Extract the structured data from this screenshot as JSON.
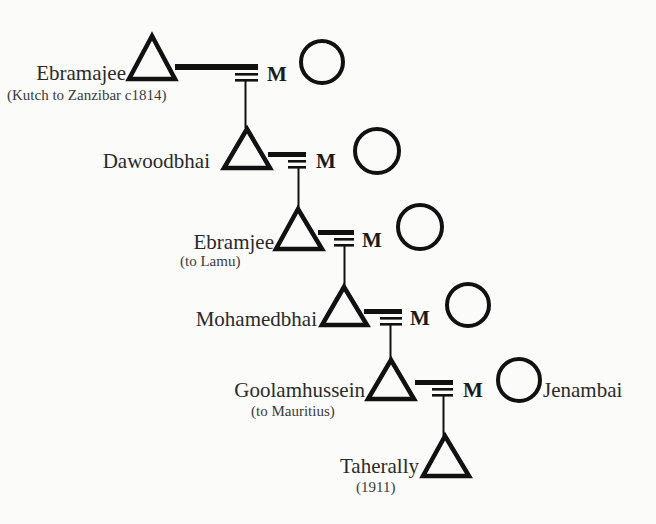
{
  "diagram": {
    "type": "genealogy-pedigree",
    "colors": {
      "stroke": "#111111",
      "text": "#2a2a2a",
      "background": "#fbfbfa"
    },
    "marriage_label": "M",
    "generations": [
      {
        "name": "Ebramajee",
        "note": "(Kutch to Zanzibar c1814)",
        "symbol": "male-triangle",
        "married": true,
        "spouse": {
          "symbol": "female-circle",
          "name": ""
        }
      },
      {
        "name": "Dawoodbhai",
        "note": "",
        "symbol": "male-triangle",
        "married": true,
        "spouse": {
          "symbol": "female-circle",
          "name": ""
        }
      },
      {
        "name": "Ebramjee",
        "note": "(to Lamu)",
        "symbol": "male-triangle",
        "married": true,
        "spouse": {
          "symbol": "female-circle",
          "name": ""
        }
      },
      {
        "name": "Mohamedbhai",
        "note": "",
        "symbol": "male-triangle",
        "married": true,
        "spouse": {
          "symbol": "female-circle",
          "name": ""
        }
      },
      {
        "name": "Goolamhussein",
        "note": "(to Mauritius)",
        "symbol": "male-triangle",
        "married": true,
        "spouse": {
          "symbol": "female-circle",
          "name": "Jenambai"
        }
      },
      {
        "name": "Taherally",
        "note": "(1911)",
        "symbol": "male-triangle",
        "married": false
      }
    ]
  }
}
